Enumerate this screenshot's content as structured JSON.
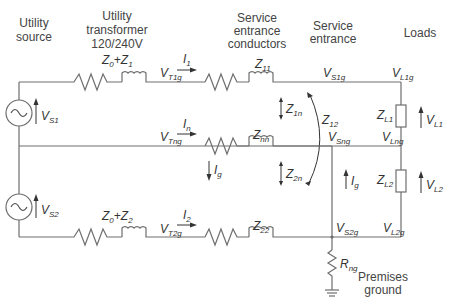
{
  "headers": {
    "utility_source": [
      "Utility",
      "source"
    ],
    "utility_transformer": [
      "Utility",
      "transformer",
      "120/240V"
    ],
    "service_entrance_conductors": [
      "Service",
      "entrance",
      "conductors"
    ],
    "service_entrance": [
      "Service",
      "entrance"
    ],
    "loads": "Loads",
    "premises_ground": [
      "Premises",
      "ground"
    ]
  },
  "labels": {
    "z0_z1": {
      "main": "Z",
      "s1": "0",
      "plus": "+Z",
      "s2": "1"
    },
    "z0_z2": {
      "main": "Z",
      "s1": "0",
      "plus": "+Z",
      "s2": "2"
    },
    "vt1g": {
      "main": "V",
      "sub": "T1g"
    },
    "vtng": {
      "main": "V",
      "sub": "Tng"
    },
    "vt2g": {
      "main": "V",
      "sub": "T2g"
    },
    "i1": {
      "main": "I",
      "sub": "1"
    },
    "in": {
      "main": "I",
      "sub": "n"
    },
    "i2": {
      "main": "I",
      "sub": "2"
    },
    "ig_left": {
      "main": "I",
      "sub": "g"
    },
    "ig_right": {
      "main": "I",
      "sub": "g"
    },
    "z11": {
      "main": "Z",
      "sub": "11"
    },
    "znn": {
      "main": "Z",
      "sub": "nn"
    },
    "z22": {
      "main": "Z",
      "sub": "22"
    },
    "z1n": {
      "main": "Z",
      "sub": "1n"
    },
    "z2n": {
      "main": "Z",
      "sub": "2n"
    },
    "z12": {
      "main": "Z",
      "sub": "12"
    },
    "vs1g": {
      "main": "V",
      "sub": "S1g"
    },
    "vsng": {
      "main": "V",
      "sub": "Sng"
    },
    "vs2g": {
      "main": "V",
      "sub": "S2g"
    },
    "vl1g": {
      "main": "V",
      "sub": "L1g"
    },
    "vlng": {
      "main": "V",
      "sub": "Lng"
    },
    "vl2g": {
      "main": "V",
      "sub": "L2g"
    },
    "zl1": {
      "main": "Z",
      "sub": "L1"
    },
    "zl2": {
      "main": "Z",
      "sub": "L2"
    },
    "vl1": {
      "main": "V",
      "sub": "L1"
    },
    "vl2": {
      "main": "V",
      "sub": "L2"
    },
    "vs1": {
      "main": "V",
      "sub": "S1"
    },
    "vs2": {
      "main": "V",
      "sub": "S2"
    },
    "rng": {
      "main": "R",
      "sub": "ng"
    }
  },
  "components": {
    "sources": [
      "ac-source-1",
      "ac-source-2"
    ],
    "loads": [
      "load-ZL1",
      "load-ZL2"
    ],
    "ground": "premises-ground-symbol"
  }
}
